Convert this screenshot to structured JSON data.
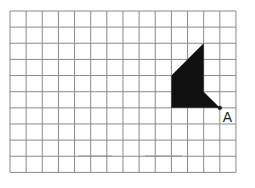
{
  "diagram": {
    "type": "grid-figure",
    "grid": {
      "columns": 14,
      "rows": 10,
      "origin_px": [
        10,
        11
      ],
      "cell_px": 16.14,
      "line_color": "#8a8a8a"
    },
    "shape": {
      "fill": "#111111",
      "vertices_grid": [
        [
          12,
          2
        ],
        [
          12,
          5
        ],
        [
          13,
          6
        ],
        [
          10,
          6
        ],
        [
          10,
          4
        ]
      ]
    },
    "point": {
      "label": "A",
      "grid": [
        13,
        6
      ],
      "color": "#222222"
    },
    "smudges": [
      {
        "x1": 78,
        "x2": 112,
        "y": 156
      },
      {
        "x1": 145,
        "x2": 182,
        "y": 156
      }
    ]
  }
}
